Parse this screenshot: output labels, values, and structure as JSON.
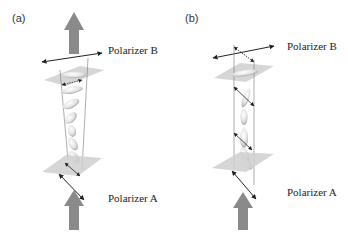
{
  "panels": [
    {
      "id": "a",
      "label": "(a)",
      "top_polarizer": "Polarizer B",
      "bottom_polarizer": "Polarizer A"
    },
    {
      "id": "b",
      "label": "(b)",
      "top_polarizer": "Polarizer B",
      "bottom_polarizer": "Polarizer A"
    }
  ],
  "colors": {
    "light_arrow": "#8a8a8a",
    "polarizer_plate": "#cfcfcf",
    "molecule_fill": "#e8e8e8",
    "molecule_shadow": "#9a9a9a",
    "line": "#222222"
  }
}
